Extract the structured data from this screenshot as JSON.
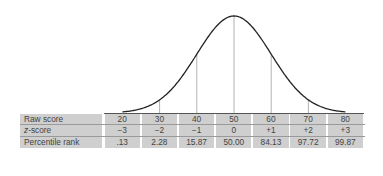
{
  "chart_data": {
    "type": "table",
    "title": "",
    "curve": "normal distribution",
    "mean": 50,
    "sd": 10,
    "vertical_markers_at": [
      30,
      40,
      50,
      60,
      70
    ],
    "columns": [
      "20",
      "30",
      "40",
      "50",
      "60",
      "70",
      "80"
    ],
    "rows": [
      {
        "label": "Raw score",
        "values": [
          "20",
          "30",
          "40",
          "50",
          "60",
          "70",
          "80"
        ]
      },
      {
        "label": "z-score",
        "values": [
          "−3",
          "−2",
          "−1",
          "0",
          "+1",
          "+2",
          "+3"
        ]
      },
      {
        "label": "Percentile rank",
        "values": [
          ".13",
          "2.28",
          "15.87",
          "50.00",
          "84.13",
          "97.72",
          "99.87"
        ]
      }
    ]
  },
  "table": {
    "labels": {
      "raw": "Raw score",
      "z_prefix": "z",
      "z_suffix": "-score",
      "pct": "Percentile rank"
    },
    "raw": [
      "20",
      "30",
      "40",
      "50",
      "60",
      "70",
      "80"
    ],
    "z": [
      "−3",
      "−2",
      "−1",
      "0",
      "+1",
      "+2",
      "+3"
    ],
    "pct": [
      ".13",
      "2.28",
      "15.87",
      "50.00",
      "84.13",
      "97.72",
      "99.87"
    ]
  },
  "colors": {
    "cell_bg": "#cfcfcf",
    "curve": "#222222",
    "marker": "#aaaaaa"
  }
}
